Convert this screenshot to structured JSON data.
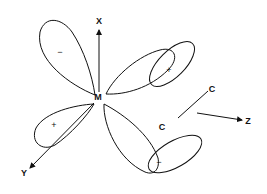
{
  "diagram": {
    "title": "",
    "nodes": {
      "metal": "M",
      "carbon_1": "C",
      "carbon_2": "C"
    },
    "axes": {
      "x": "X",
      "y": "Y",
      "z": "Z"
    },
    "lobe_signs": {
      "upper_left": "−",
      "upper_right": "+",
      "lower_left": "+",
      "lower_right": "−"
    },
    "colors": {
      "ink": "#111111",
      "background": "#ffffff"
    }
  }
}
